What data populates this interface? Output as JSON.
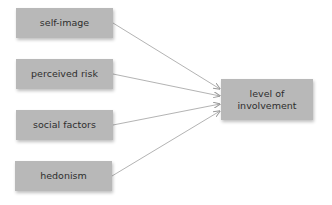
{
  "diagram": {
    "sources": [
      {
        "id": "self-image",
        "label": "self-image"
      },
      {
        "id": "perceived-risk",
        "label": "perceived risk"
      },
      {
        "id": "social-factors",
        "label": "social factors"
      },
      {
        "id": "hedonism",
        "label": "hedonism"
      }
    ],
    "target": {
      "id": "level-of-involvement",
      "label_line1": "level of",
      "label_line2": "involvement"
    },
    "edges": [
      {
        "from": "self-image",
        "to": "level-of-involvement"
      },
      {
        "from": "perceived-risk",
        "to": "level-of-involvement"
      },
      {
        "from": "social-factors",
        "to": "level-of-involvement"
      },
      {
        "from": "hedonism",
        "to": "level-of-involvement"
      }
    ],
    "colors": {
      "box_fill": "#b8b8b8",
      "text": "#2e2e2e",
      "line": "#9a9a9a"
    }
  }
}
